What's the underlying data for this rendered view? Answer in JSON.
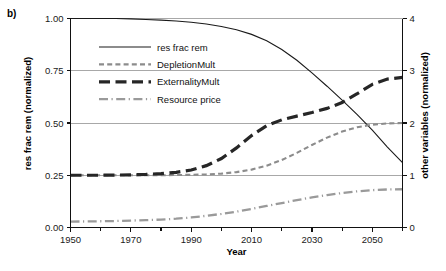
{
  "panel": {
    "label": "b)"
  },
  "chart_data": {
    "type": "line",
    "title": "",
    "subtitle": "",
    "xlabel": "Year",
    "ylabel": "res frac rem (normalized)",
    "ylabel_right": "other variables (normalized)",
    "xlim": [
      1950,
      2060
    ],
    "ylim": [
      0.0,
      1.0
    ],
    "ylim_right": [
      0,
      4
    ],
    "grid": true,
    "grid_axis": "y",
    "legend_position": "upper-left-inside",
    "xticks": [
      1950,
      1970,
      1990,
      2010,
      2030,
      2050
    ],
    "xtick_labels": [
      "1950",
      "1970",
      "1990",
      "2010",
      "2030",
      "2050"
    ],
    "xminor_ticks": [
      1960,
      1980,
      2000,
      2020,
      2040,
      2060
    ],
    "yticks": [
      0.0,
      0.25,
      0.5,
      0.75,
      1.0
    ],
    "ytick_labels": [
      "0.00",
      "0.25",
      "0.50",
      "0.75",
      "1.00"
    ],
    "yticks_right": [
      0,
      1,
      2,
      3,
      4
    ],
    "ytick_labels_right": [
      "0",
      "1",
      "2",
      "3",
      "4"
    ],
    "x": [
      1950,
      1955,
      1960,
      1965,
      1970,
      1975,
      1980,
      1985,
      1990,
      1995,
      2000,
      2005,
      2010,
      2015,
      2020,
      2025,
      2030,
      2035,
      2040,
      2045,
      2050,
      2055,
      2060
    ],
    "series": [
      {
        "name": "res frac rem",
        "axis": "left",
        "style": "solid",
        "color": "#1a1a1a",
        "width": 1.1,
        "values": [
          1.0,
          1.0,
          1.0,
          1.0,
          0.998,
          0.995,
          0.992,
          0.988,
          0.982,
          0.974,
          0.962,
          0.946,
          0.924,
          0.893,
          0.852,
          0.8,
          0.74,
          0.676,
          0.609,
          0.54,
          0.466,
          0.385,
          0.31
        ]
      },
      {
        "name": "DepletionMult",
        "axis": "right",
        "style": "dashed",
        "color": "#8c8c8c",
        "width": 2.1,
        "values_left_scale": [
          0.25,
          0.25,
          0.25,
          0.25,
          0.25,
          0.25,
          0.25,
          0.251,
          0.252,
          0.254,
          0.258,
          0.265,
          0.277,
          0.296,
          0.323,
          0.357,
          0.395,
          0.43,
          0.459,
          0.48,
          0.492,
          0.498,
          0.5
        ],
        "values_right_scale": [
          1.0,
          1.0,
          1.0,
          1.0,
          1.0,
          1.0,
          1.0,
          1.004,
          1.008,
          1.016,
          1.032,
          1.06,
          1.108,
          1.184,
          1.292,
          1.428,
          1.58,
          1.72,
          1.836,
          1.92,
          1.968,
          1.992,
          2.0
        ]
      },
      {
        "name": "ExternalityMult",
        "axis": "right",
        "style": "thick-dashed",
        "color": "#262626",
        "width": 3.2,
        "values_left_scale": [
          0.25,
          0.25,
          0.25,
          0.251,
          0.252,
          0.254,
          0.258,
          0.264,
          0.275,
          0.296,
          0.33,
          0.381,
          0.44,
          0.487,
          0.515,
          0.533,
          0.55,
          0.57,
          0.598,
          0.64,
          0.685,
          0.71,
          0.718
        ],
        "values_right_scale": [
          1.0,
          1.0,
          1.0,
          1.004,
          1.008,
          1.016,
          1.032,
          1.056,
          1.1,
          1.184,
          1.32,
          1.524,
          1.76,
          1.948,
          2.06,
          2.132,
          2.2,
          2.28,
          2.392,
          2.56,
          2.74,
          2.84,
          2.872
        ]
      },
      {
        "name": "Resource price",
        "axis": "right",
        "style": "dash-dot",
        "color": "#9a9a9a",
        "width": 2.3,
        "values_left_scale": [
          0.028,
          0.029,
          0.03,
          0.031,
          0.033,
          0.035,
          0.038,
          0.042,
          0.048,
          0.056,
          0.065,
          0.076,
          0.089,
          0.103,
          0.117,
          0.131,
          0.144,
          0.155,
          0.165,
          0.173,
          0.179,
          0.182,
          0.183
        ],
        "values_right_scale": [
          0.112,
          0.116,
          0.12,
          0.124,
          0.132,
          0.14,
          0.152,
          0.168,
          0.192,
          0.224,
          0.26,
          0.304,
          0.356,
          0.412,
          0.468,
          0.524,
          0.576,
          0.62,
          0.66,
          0.692,
          0.716,
          0.728,
          0.732
        ]
      }
    ],
    "legend": [
      {
        "label": "res frac rem",
        "style": "solid",
        "color": "#1a1a1a"
      },
      {
        "label": "DepletionMult",
        "style": "dashed",
        "color": "#8c8c8c"
      },
      {
        "label": "ExternalityMult",
        "style": "thick-dashed",
        "color": "#262626"
      },
      {
        "label": "Resource price",
        "style": "dash-dot",
        "color": "#9a9a9a"
      }
    ]
  }
}
